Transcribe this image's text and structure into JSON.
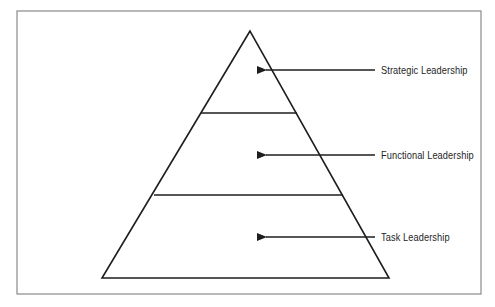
{
  "diagram": {
    "type": "pyramid",
    "title": "",
    "frame": {
      "border_color": "#8a8a8a",
      "x": 17,
      "y": 11,
      "width": 464,
      "height": 283
    },
    "line_color": "#1e1e1e",
    "pyramid": {
      "apex": [
        250,
        31
      ],
      "base_left": [
        102,
        278
      ],
      "base_right": [
        389,
        278
      ],
      "dividers": [
        {
          "y": 113,
          "x1": 201,
          "x2": 297
        },
        {
          "y": 195,
          "x1": 154,
          "x2": 343
        }
      ]
    },
    "levels": [
      {
        "label": "Strategic Leadership",
        "tier": "top",
        "arrow_y": 70,
        "arrow_tip_x": 264,
        "arrow_tail_x": 375,
        "label_x": 381
      },
      {
        "label": "Functional Leadership",
        "tier": "middle",
        "arrow_y": 155,
        "arrow_tip_x": 264,
        "arrow_tail_x": 375,
        "label_x": 381
      },
      {
        "label": "Task Leadership",
        "tier": "bottom",
        "arrow_y": 237,
        "arrow_tip_x": 264,
        "arrow_tail_x": 375,
        "label_x": 381
      }
    ]
  }
}
